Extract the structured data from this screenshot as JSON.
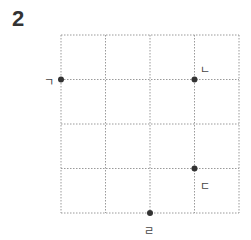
{
  "problem_number": "2",
  "grid": {
    "rows": 4,
    "cols": 4,
    "left": 61,
    "top": 35,
    "cell": 44.5,
    "line_color": "#9a9a9a"
  },
  "points": [
    {
      "label": "ㄱ",
      "col": 0,
      "row": 1
    },
    {
      "label": "ㄴ",
      "col": 3,
      "row": 1
    },
    {
      "label": "ㄷ",
      "col": 3,
      "row": 3
    },
    {
      "label": "ㄹ",
      "col": 2,
      "row": 4
    }
  ],
  "point_color": "#333333"
}
